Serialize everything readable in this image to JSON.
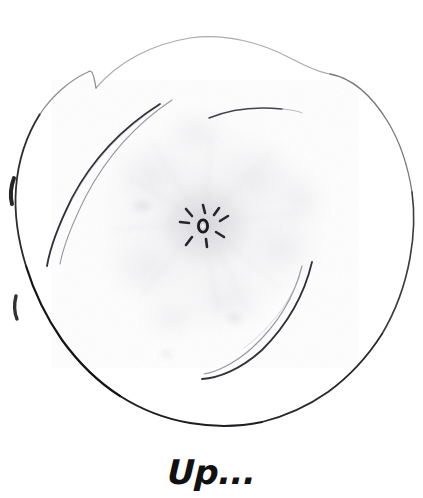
{
  "page": {
    "width": 423,
    "height": 498,
    "background_color": "#ffffff",
    "medium": "pencil-sketch"
  },
  "caption": {
    "text": "Up...",
    "color": "#111111"
  },
  "artwork": {
    "title": "flower-sketch",
    "line_color": "#1a1a1a",
    "wash_color": "#e8e8ea",
    "center_color": "#2a2a2a",
    "outline": {
      "name": "circular-bloom-outline",
      "center_x": 210,
      "center_y": 228,
      "radius_x": 205,
      "radius_y": 198
    },
    "center_dot": {
      "x": 203,
      "y": 226,
      "radius": 5
    },
    "stamen_count": 8,
    "petal_arcs": [
      {
        "name": "upper-left-petal-arc"
      },
      {
        "name": "lower-right-petal-arc"
      },
      {
        "name": "top-short-arc"
      }
    ]
  }
}
